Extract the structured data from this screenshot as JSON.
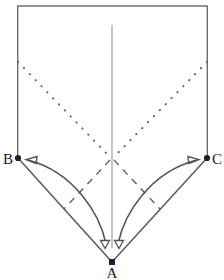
{
  "figure": {
    "background_color": "#ffffff",
    "stroke_color": "#555a5e",
    "solid_color": "#4d5257",
    "label_color": "#1a1a1a",
    "width": 224,
    "height": 280
  },
  "labels": {
    "vertex_a": "A",
    "vertex_b": "B",
    "vertex_c": "C"
  },
  "geometry": {
    "top_left": {
      "x": 17,
      "y": 6
    },
    "top_right": {
      "x": 208,
      "y": 6
    },
    "vertex_b": {
      "x": 18,
      "y": 158
    },
    "vertex_c": {
      "x": 207,
      "y": 158
    },
    "vertex_a": {
      "x": 112,
      "y": 262
    },
    "center": {
      "x": 112,
      "y": 158
    },
    "axis_top": {
      "x": 112,
      "y": 25
    },
    "axis_bottom": {
      "x": 112,
      "y": 248
    },
    "dotted_left_start": {
      "x": 18,
      "y": 62
    },
    "dotted_right_start": {
      "x": 207,
      "y": 62
    },
    "dashed_left_end": {
      "x": 64,
      "y": 209
    },
    "dashed_right_end": {
      "x": 160,
      "y": 209
    },
    "arrow_left_tip": {
      "x": 26,
      "y": 160
    },
    "arrow_right_tip": {
      "x": 199,
      "y": 160
    },
    "arrow_down_left_tip": {
      "x": 105,
      "y": 248
    },
    "arrow_down_right_tip": {
      "x": 119,
      "y": 248
    }
  },
  "elements": {
    "outline_name": "pentagon-outline",
    "axis_name": "vertical-axis-line",
    "dotted_left_name": "dotted-line-b-to-center",
    "dotted_right_name": "dotted-line-c-to-center",
    "dashed_left_name": "dashed-perpendicular-left",
    "dashed_right_name": "dashed-perpendicular-right",
    "arc_left_name": "curved-arrow-to-b",
    "arc_right_name": "curved-arrow-to-c",
    "arrow_down_left_name": "down-arrow-left",
    "arrow_down_right_name": "down-arrow-right"
  }
}
